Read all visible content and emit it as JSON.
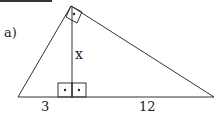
{
  "figure": {
    "part_label": "a)",
    "altitude_label": "x",
    "segment_left_label": "3",
    "segment_right_label": "12",
    "stroke_color": "#333333",
    "background": "#ffffff"
  }
}
